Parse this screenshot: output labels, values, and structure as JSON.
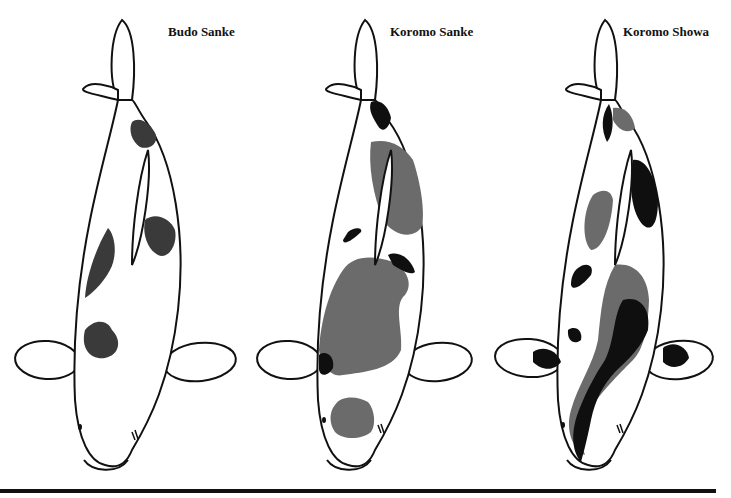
{
  "figure": {
    "labels": [
      {
        "text": "Budo Sanke"
      },
      {
        "text": "Koromo Sanke"
      },
      {
        "text": "Koromo Showa"
      }
    ],
    "colors": {
      "outline": "#111111",
      "sumi_black": "#0f0f0f",
      "hi_gray": "#6b6b6b",
      "body": "#ffffff"
    }
  }
}
